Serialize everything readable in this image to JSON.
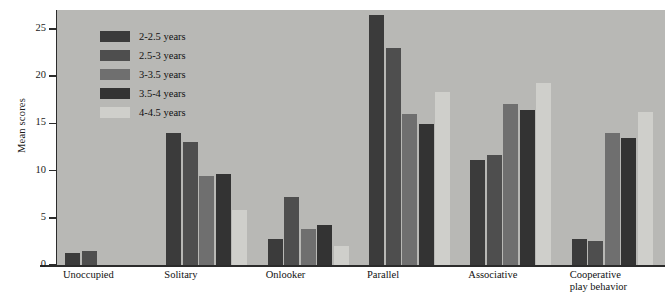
{
  "chart_data": {
    "type": "bar",
    "title": "",
    "xlabel": "",
    "ylabel": "Mean scores",
    "ylim": [
      0,
      27
    ],
    "yticks": [
      0,
      5,
      10,
      15,
      20,
      25
    ],
    "grid": false,
    "legend_position": "upper-left-inside",
    "categories": [
      "Unoccupied",
      "Solitary",
      "Onlooker",
      "Parallel",
      "Associative",
      "Cooperative\nplay behavior"
    ],
    "series": [
      {
        "name": "2-2.5 years",
        "color": "#3b3b3b",
        "values": [
          1.3,
          14.0,
          2.8,
          26.5,
          11.1,
          2.8
        ]
      },
      {
        "name": "2.5-3 years",
        "color": "#4e4e4e",
        "values": [
          1.5,
          13.0,
          7.2,
          23.0,
          11.7,
          2.5
        ]
      },
      {
        "name": "3-3.5 years",
        "color": "#6f6f6f",
        "values": [
          0.0,
          9.4,
          3.8,
          16.0,
          17.0,
          14.0
        ]
      },
      {
        "name": "3.5-4 years",
        "color": "#333333",
        "values": [
          0.0,
          9.6,
          4.2,
          14.9,
          16.4,
          13.5
        ]
      },
      {
        "name": "4-4.5 years",
        "color": "#cfcfcb",
        "values": [
          0.0,
          5.8,
          2.0,
          18.3,
          19.3,
          16.2
        ]
      }
    ]
  },
  "axis": {
    "y_title": "Mean scores"
  },
  "colors": {
    "plot_background": "#b8b8b5",
    "axis": "#2b2b2b",
    "text": "#111111"
  }
}
